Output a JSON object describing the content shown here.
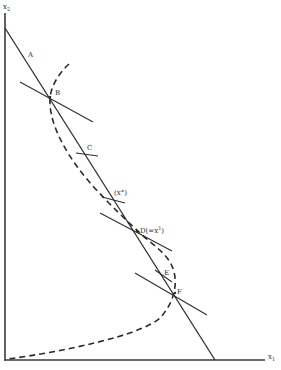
{
  "diagram": {
    "axes": {
      "y_label": "x",
      "y_label_sub": "2",
      "x_label": "x",
      "x_label_sub": "1"
    },
    "points": {
      "A": "A",
      "B": "B",
      "C": "C",
      "x0": "(x°)",
      "D_main": "D(=x",
      "D_sup": "1",
      "D_close": ")",
      "E": "E",
      "F": "F"
    },
    "colors": {
      "line": "#2e2e2e",
      "background": "#ffffff"
    }
  }
}
